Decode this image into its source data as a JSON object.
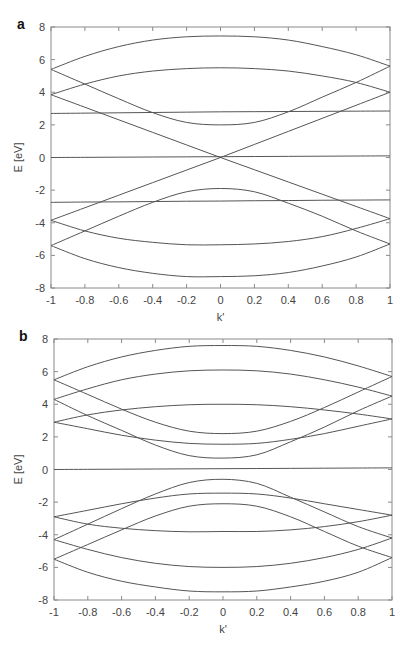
{
  "chart_data": [
    {
      "panel_label": "a",
      "type": "line",
      "title": "",
      "xlabel": "k'",
      "ylabel": "E [eV]",
      "xlim": [
        -1,
        1
      ],
      "ylim": [
        -8,
        8
      ],
      "xticks": [
        "-1",
        "-0.8",
        "-0.6",
        "-0.4",
        "-0.2",
        "0",
        "0.2",
        "0.4",
        "0.6",
        "0.8",
        "1"
      ],
      "yticks": [
        "8",
        "6",
        "4",
        "2",
        "0",
        "-2",
        "-4",
        "-6",
        "-8"
      ],
      "grid": false,
      "legend": null,
      "line_color": "#555555",
      "x": [
        -1,
        -0.8,
        -0.6,
        -0.4,
        -0.2,
        0,
        0.2,
        0.4,
        0.6,
        0.8,
        1
      ],
      "series": [
        {
          "name": "band-1",
          "values": [
            5.4,
            6.2,
            6.8,
            7.2,
            7.4,
            7.45,
            7.4,
            7.2,
            6.8,
            6.3,
            5.6
          ]
        },
        {
          "name": "band-2",
          "values": [
            3.85,
            4.5,
            5.0,
            5.3,
            5.45,
            5.5,
            5.45,
            5.3,
            5.0,
            4.6,
            4.0
          ]
        },
        {
          "name": "band-3",
          "values": [
            5.4,
            4.5,
            3.6,
            2.75,
            2.15,
            2.0,
            2.15,
            2.8,
            3.7,
            4.6,
            5.6
          ]
        },
        {
          "name": "band-4",
          "values": [
            3.85,
            3.08,
            2.31,
            1.54,
            0.77,
            0.0,
            -0.75,
            -1.5,
            -2.25,
            -3.0,
            -3.75
          ]
        },
        {
          "name": "band-5",
          "values": [
            -3.85,
            -3.08,
            -2.31,
            -1.54,
            -0.77,
            0.0,
            0.8,
            1.6,
            2.4,
            3.2,
            4.0
          ]
        },
        {
          "name": "band-6",
          "values": [
            2.7,
            2.72,
            2.74,
            2.76,
            2.78,
            2.8,
            2.81,
            2.82,
            2.83,
            2.84,
            2.85
          ]
        },
        {
          "name": "band-7",
          "values": [
            0.0,
            0.01,
            0.02,
            0.03,
            0.04,
            0.05,
            0.06,
            0.07,
            0.08,
            0.09,
            0.1
          ]
        },
        {
          "name": "band-8",
          "values": [
            -2.75,
            -2.73,
            -2.72,
            -2.7,
            -2.68,
            -2.67,
            -2.65,
            -2.64,
            -2.62,
            -2.61,
            -2.6
          ]
        },
        {
          "name": "band-9",
          "values": [
            -5.4,
            -4.5,
            -3.6,
            -2.75,
            -2.1,
            -1.9,
            -2.1,
            -2.8,
            -3.6,
            -4.5,
            -5.3
          ]
        },
        {
          "name": "band-10",
          "values": [
            -3.85,
            -4.5,
            -4.95,
            -5.2,
            -5.35,
            -5.35,
            -5.3,
            -5.15,
            -4.85,
            -4.35,
            -3.75
          ]
        },
        {
          "name": "band-11",
          "values": [
            -5.4,
            -6.2,
            -6.75,
            -7.1,
            -7.3,
            -7.3,
            -7.25,
            -7.05,
            -6.65,
            -6.1,
            -5.3
          ]
        }
      ]
    },
    {
      "panel_label": "b",
      "type": "line",
      "title": "",
      "xlabel": "k'",
      "ylabel": "E [eV]",
      "xlim": [
        -1,
        1
      ],
      "ylim": [
        -8,
        8
      ],
      "xticks": [
        "-1",
        "-0.8",
        "-0.6",
        "-0.4",
        "-0.2",
        "0",
        "0.2",
        "0.4",
        "0.6",
        "0.8",
        "1"
      ],
      "yticks": [
        "8",
        "6",
        "4",
        "2",
        "0",
        "-2",
        "-4",
        "-6",
        "-8"
      ],
      "grid": false,
      "legend": null,
      "line_color": "#555555",
      "x": [
        -1,
        -0.8,
        -0.6,
        -0.4,
        -0.2,
        0,
        0.2,
        0.4,
        0.6,
        0.8,
        1
      ],
      "series": [
        {
          "name": "band-1",
          "values": [
            5.5,
            6.3,
            6.9,
            7.3,
            7.55,
            7.6,
            7.55,
            7.3,
            6.9,
            6.35,
            5.7
          ]
        },
        {
          "name": "band-2",
          "values": [
            4.3,
            4.95,
            5.5,
            5.85,
            6.05,
            6.1,
            6.05,
            5.85,
            5.5,
            5.05,
            4.5
          ]
        },
        {
          "name": "band-3",
          "values": [
            5.5,
            4.6,
            3.7,
            2.9,
            2.35,
            2.2,
            2.35,
            2.95,
            3.8,
            4.75,
            5.7
          ]
        },
        {
          "name": "band-4",
          "values": [
            4.3,
            3.3,
            2.4,
            1.5,
            0.85,
            0.7,
            0.9,
            1.7,
            2.6,
            3.6,
            4.5
          ]
        },
        {
          "name": "band-5",
          "values": [
            2.9,
            3.35,
            3.65,
            3.85,
            3.97,
            4.0,
            3.97,
            3.85,
            3.65,
            3.4,
            3.1
          ]
        },
        {
          "name": "band-6",
          "values": [
            2.9,
            2.5,
            2.1,
            1.8,
            1.6,
            1.55,
            1.6,
            1.85,
            2.2,
            2.65,
            3.1
          ]
        },
        {
          "name": "band-7",
          "values": [
            0.0,
            0.01,
            0.02,
            0.03,
            0.04,
            0.05,
            0.06,
            0.07,
            0.08,
            0.09,
            0.1
          ]
        },
        {
          "name": "band-8",
          "values": [
            -2.9,
            -2.5,
            -2.1,
            -1.75,
            -1.5,
            -1.45,
            -1.5,
            -1.75,
            -2.1,
            -2.45,
            -2.8
          ]
        },
        {
          "name": "band-9",
          "values": [
            -4.3,
            -3.35,
            -2.4,
            -1.5,
            -0.8,
            -0.6,
            -0.85,
            -1.7,
            -2.6,
            -3.5,
            -4.2
          ]
        },
        {
          "name": "band-10",
          "values": [
            -5.5,
            -4.6,
            -3.7,
            -2.85,
            -2.25,
            -2.1,
            -2.25,
            -2.9,
            -3.8,
            -4.7,
            -5.4
          ]
        },
        {
          "name": "band-11",
          "values": [
            -2.9,
            -3.35,
            -3.6,
            -3.75,
            -3.82,
            -3.8,
            -3.8,
            -3.7,
            -3.5,
            -3.2,
            -2.8
          ]
        },
        {
          "name": "band-12",
          "values": [
            -4.3,
            -4.9,
            -5.4,
            -5.75,
            -5.95,
            -6.0,
            -5.95,
            -5.75,
            -5.4,
            -4.9,
            -4.2
          ]
        },
        {
          "name": "band-13",
          "values": [
            -5.5,
            -6.3,
            -6.85,
            -7.2,
            -7.45,
            -7.5,
            -7.45,
            -7.2,
            -6.85,
            -6.3,
            -5.4
          ]
        }
      ]
    }
  ]
}
